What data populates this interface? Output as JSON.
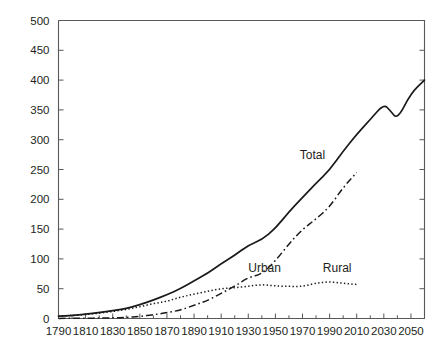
{
  "top_fragment": "                                      ",
  "chart_data": {
    "type": "line",
    "title": "",
    "subtitle": "",
    "xlabel": "",
    "ylabel": "",
    "xlim": [
      1790,
      2060
    ],
    "ylim": [
      0,
      500
    ],
    "grid": false,
    "legend_position": "inline-annotations",
    "x_ticks": [
      1790,
      1810,
      1830,
      1850,
      1870,
      1890,
      1910,
      1930,
      1950,
      1970,
      1990,
      2010,
      2030,
      2050
    ],
    "x_tick_labels": [
      "1790",
      "1810",
      "1830",
      "1850",
      "1870",
      "1890",
      "1910",
      "1930",
      "1950",
      "1970",
      "1990",
      "2010",
      "2030",
      "2050"
    ],
    "y_ticks": [
      0,
      50,
      100,
      150,
      200,
      250,
      300,
      350,
      400,
      450,
      500
    ],
    "y_tick_labels": [
      "0",
      "50",
      "100",
      "150",
      "200",
      "250",
      "300",
      "350",
      "400",
      "450",
      "500"
    ],
    "series": [
      {
        "name": "Total",
        "style": "solid",
        "label": "Total",
        "label_x": 1968,
        "label_y": 268,
        "x": [
          1790,
          1800,
          1810,
          1820,
          1830,
          1840,
          1850,
          1860,
          1870,
          1880,
          1890,
          1900,
          1910,
          1920,
          1930,
          1940,
          1950,
          1960,
          1970,
          1980,
          1990,
          2000,
          2010,
          2020,
          2030,
          2035,
          2040,
          2050,
          2060
        ],
        "values": [
          4,
          5,
          7,
          10,
          13,
          17,
          23,
          31,
          40,
          50,
          63,
          76,
          92,
          106,
          123,
          132,
          151,
          179,
          203,
          227,
          249,
          281,
          309,
          334,
          360,
          348,
          334,
          378,
          400
        ]
      },
      {
        "name": "Urban",
        "style": "dash-dot",
        "label": "Urban",
        "label_x": 1930,
        "label_y": 78,
        "x": [
          1790,
          1800,
          1810,
          1820,
          1830,
          1840,
          1850,
          1860,
          1870,
          1880,
          1890,
          1900,
          1910,
          1920,
          1930,
          1940,
          1950,
          1960,
          1970,
          1980,
          1990,
          2000,
          2010
        ],
        "values": [
          0.2,
          0.3,
          0.5,
          0.7,
          1.1,
          1.8,
          3.5,
          6.2,
          9.9,
          14.1,
          22.1,
          30.2,
          42.0,
          54.2,
          69.0,
          74.4,
          96.5,
          125.3,
          149.6,
          167.1,
          187.1,
          220.0,
          245.0
        ]
      },
      {
        "name": "Rural",
        "style": "dotted",
        "label": "Rural",
        "label_x": 1985,
        "label_y": 78,
        "x": [
          1790,
          1800,
          1810,
          1820,
          1830,
          1840,
          1850,
          1860,
          1870,
          1880,
          1890,
          1900,
          1910,
          1920,
          1930,
          1940,
          1950,
          1960,
          1970,
          1980,
          1990,
          2000,
          2010
        ],
        "values": [
          3.7,
          4.9,
          6.7,
          8.9,
          11.7,
          15.2,
          19.6,
          25.2,
          28.7,
          36.0,
          40.8,
          45.8,
          50.0,
          51.6,
          54.0,
          57.2,
          54.5,
          54.0,
          53.6,
          59.5,
          61.7,
          59.1,
          57.0
        ]
      }
    ]
  }
}
